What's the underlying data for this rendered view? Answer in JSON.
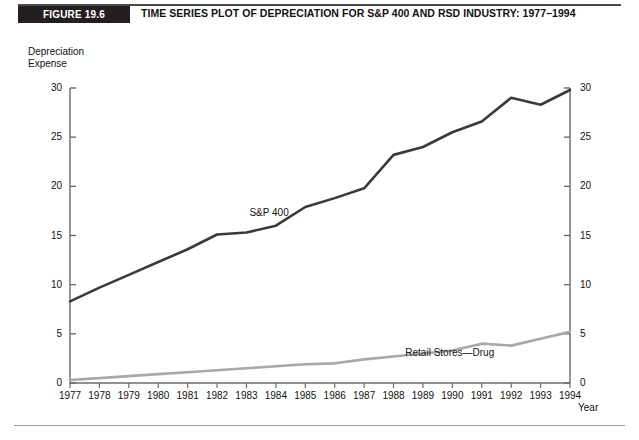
{
  "header": {
    "badge_label": "FIGURE 19.6",
    "title": "TIME SERIES PLOT OF DEPRECIATION FOR S&P 400 AND RSD INDUSTRY: 1977–1994",
    "badge_bg": "#231f20",
    "badge_fg": "#ffffff",
    "rule_color": "#4a4a4a"
  },
  "chart_data": {
    "type": "line",
    "title": "TIME SERIES PLOT OF DEPRECIATION FOR S&P 400 AND RSD INDUSTRY: 1977–1994",
    "subtitle": "",
    "xlabel": "Year",
    "ylabel": "Depreciation Expense",
    "ylabel_line1": "Depreciation",
    "ylabel_line2": "Expense",
    "grid": false,
    "legend_position": "inline-annotations",
    "x": [
      1977,
      1978,
      1979,
      1980,
      1981,
      1982,
      1983,
      1984,
      1985,
      1986,
      1987,
      1988,
      1989,
      1990,
      1991,
      1992,
      1993,
      1994
    ],
    "categories": [
      "1977",
      "1978",
      "1979",
      "1980",
      "1981",
      "1982",
      "1983",
      "1984",
      "1985",
      "1986",
      "1987",
      "1988",
      "1989",
      "1990",
      "1991",
      "1992",
      "1993",
      "1994"
    ],
    "xlim": [
      1977,
      1994
    ],
    "ylim": [
      0,
      30
    ],
    "yticks": [
      0,
      5,
      10,
      15,
      20,
      25,
      30
    ],
    "ytick_labels_left": [
      "0",
      "5",
      "10",
      "15",
      "20",
      "25",
      "30"
    ],
    "ytick_labels_right": [
      "0",
      "5",
      "10",
      "15",
      "20",
      "25",
      "30"
    ],
    "right_axis": true,
    "series": [
      {
        "name": "S&P 400",
        "color": "#3a3a3a",
        "line_width": 2.6,
        "label_x": 1983.1,
        "label_y": 20.7,
        "values": [
          8.3,
          9.7,
          11.0,
          12.3,
          13.6,
          15.1,
          15.3,
          16.0,
          17.9,
          18.8,
          19.8,
          23.2,
          24.0,
          25.5,
          26.6,
          29.0,
          28.3,
          29.8
        ]
      },
      {
        "name": "Retail Stores—Drug",
        "color": "#a8a8a8",
        "line_width": 2.6,
        "label_x": 1988.4,
        "label_y": 6.5,
        "values": [
          0.3,
          0.5,
          0.7,
          0.9,
          1.1,
          1.3,
          1.5,
          1.7,
          1.9,
          2.0,
          2.4,
          2.7,
          3.0,
          3.3,
          4.0,
          3.8,
          4.5,
          5.2
        ]
      }
    ],
    "axis_color": "#6b6b6b",
    "text_color": "#111111"
  }
}
